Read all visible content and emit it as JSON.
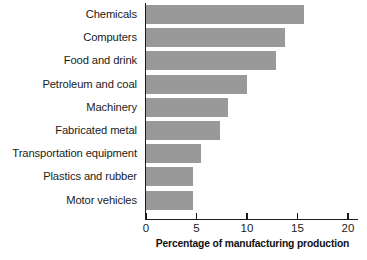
{
  "chart_data": {
    "type": "bar",
    "orientation": "horizontal",
    "title": "",
    "xlabel": "Percentage of manufacturing production",
    "ylabel": "",
    "categories": [
      "Chemicals",
      "Computers",
      "Food and drink",
      "Petroleum and coal",
      "Machinery",
      "Fabricated metal",
      "Transportation equipment",
      "Plastics and rubber",
      "Motor vehicles"
    ],
    "values": [
      15.7,
      13.8,
      12.9,
      10.0,
      8.1,
      7.3,
      5.4,
      4.7,
      4.7
    ],
    "xlim": [
      0,
      21
    ],
    "xticks": [
      0,
      5,
      10,
      15,
      20
    ],
    "xtick_labels": [
      "0",
      "5",
      "10",
      "15",
      "20"
    ],
    "grid": false,
    "legend": false,
    "bar_color": "#999999",
    "axis_color": "#1a1a1a",
    "background_color": "#ffffff"
  }
}
